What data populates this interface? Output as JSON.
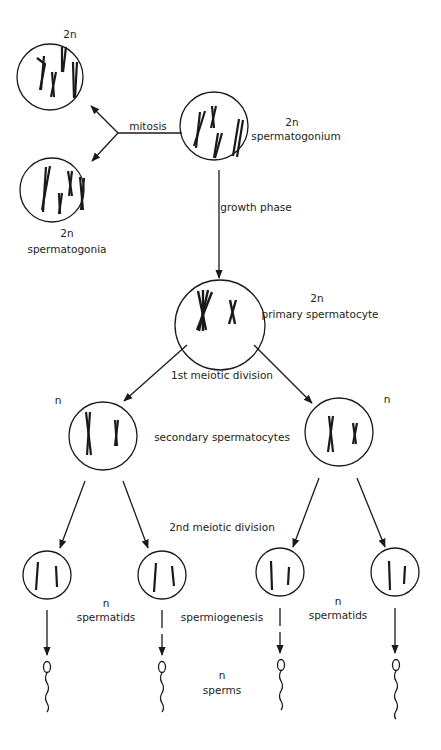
{
  "diagram": {
    "colors": {
      "ink": "#1a1a1a",
      "background": "#ffffff"
    },
    "labels": {
      "mitosis": "mitosis",
      "growth_phase": "growth phase",
      "first_meiotic_division": "1st meiotic division",
      "second_meiotic_division": "2nd meiotic division",
      "spermiogenesis": "spermiogenesis"
    },
    "stages": {
      "spermatogonium": {
        "ploidy": "2n",
        "name": "spermatogonium"
      },
      "daughter_top": {
        "ploidy": "2n"
      },
      "spermatogonia": {
        "ploidy": "2n",
        "name": "spermatogonia"
      },
      "primary_spermatocyte": {
        "ploidy": "2n",
        "name": "primary spermatocyte"
      },
      "secondary_spermatocytes": {
        "ploidy_left": "n",
        "ploidy_right": "n",
        "name": "secondary spermatocytes"
      },
      "spermatids_left": {
        "ploidy": "n",
        "name": "spermatids"
      },
      "spermatids_right": {
        "ploidy": "n",
        "name": "spermatids"
      },
      "sperms": {
        "ploidy": "n",
        "name": "sperms"
      }
    }
  }
}
